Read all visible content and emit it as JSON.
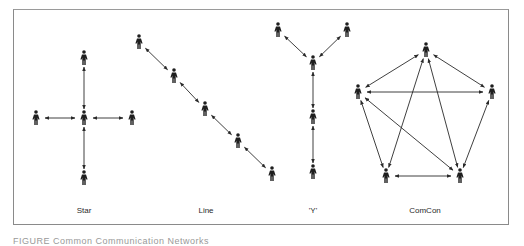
{
  "figure": {
    "labels": {
      "star": "Star",
      "line": "Line",
      "y": "'Y'",
      "comcon": "ComCon"
    },
    "caption": "FIGURE  Common Communication Networks",
    "colors": {
      "border": "#8a8a8a",
      "ink": "#2a2a2a"
    }
  },
  "networks": [
    {
      "name": "Star",
      "nodes": [
        [
          84,
          58
        ],
        [
          84,
          118
        ],
        [
          36,
          118
        ],
        [
          132,
          118
        ],
        [
          84,
          178
        ]
      ],
      "edges": [
        [
          0,
          1
        ],
        [
          2,
          1
        ],
        [
          1,
          3
        ],
        [
          1,
          4
        ]
      ]
    },
    {
      "name": "Line",
      "nodes": [
        [
          139,
          42
        ],
        [
          174,
          76
        ],
        [
          205,
          109
        ],
        [
          238,
          141
        ],
        [
          272,
          174
        ]
      ],
      "edges": [
        [
          0,
          1
        ],
        [
          1,
          2
        ],
        [
          2,
          3
        ],
        [
          3,
          4
        ]
      ]
    },
    {
      "name": "'Y'",
      "nodes": [
        [
          278,
          30
        ],
        [
          347,
          30
        ],
        [
          313,
          63
        ],
        [
          313,
          117
        ],
        [
          313,
          172
        ]
      ],
      "edges": [
        [
          0,
          2
        ],
        [
          1,
          2
        ],
        [
          2,
          3
        ],
        [
          3,
          4
        ]
      ]
    },
    {
      "name": "ComCon",
      "nodes": [
        [
          426,
          50
        ],
        [
          358,
          92
        ],
        [
          492,
          92
        ],
        [
          386,
          176
        ],
        [
          460,
          176
        ]
      ],
      "edges": [
        [
          0,
          1
        ],
        [
          0,
          2
        ],
        [
          1,
          2
        ],
        [
          1,
          3
        ],
        [
          1,
          4
        ],
        [
          0,
          3
        ],
        [
          0,
          4
        ],
        [
          2,
          4
        ],
        [
          3,
          4
        ]
      ]
    }
  ]
}
